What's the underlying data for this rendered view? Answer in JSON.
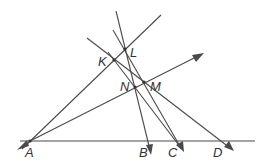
{
  "diagram": {
    "type": "geometry",
    "stroke_color": "#4a4a4a",
    "points": {
      "A": {
        "label": "A",
        "x": 30,
        "y": 141
      },
      "B": {
        "label": "B",
        "x": 148,
        "y": 141
      },
      "C": {
        "label": "C",
        "x": 176,
        "y": 141
      },
      "D": {
        "label": "D",
        "x": 222,
        "y": 141
      },
      "K": {
        "label": "K",
        "x": 114,
        "y": 60
      },
      "L": {
        "label": "L",
        "x": 125,
        "y": 49
      },
      "M": {
        "label": "M",
        "x": 144,
        "y": 82
      },
      "N": {
        "label": "N",
        "x": 135,
        "y": 87
      }
    },
    "labels": [
      "A",
      "B",
      "C",
      "D",
      "K",
      "L",
      "M",
      "N"
    ]
  }
}
